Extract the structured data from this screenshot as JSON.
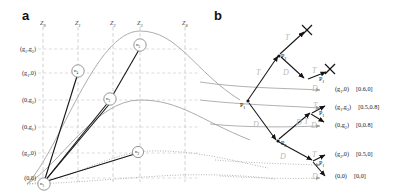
{
  "figure": {
    "panel_a_letter": "a",
    "panel_b_letter": "b"
  },
  "panel_a": {
    "z_labels": [
      "Z0",
      "Z1",
      "Z2",
      "Z3",
      "Z4"
    ],
    "y_labels": [
      "(g1,g2)",
      "(g1,0)",
      "(0,g2)",
      "(0,g1)",
      "(g2,0)",
      "(0,0)"
    ],
    "nodes": [
      {
        "id": "n5",
        "label": "n5"
      },
      {
        "id": "n4",
        "label": "n4"
      },
      {
        "id": "n3",
        "label": "n3"
      },
      {
        "id": "n2",
        "label": "n2"
      },
      {
        "id": "n1",
        "label": "n1"
      }
    ]
  },
  "panel_b": {
    "decision_nodes": [
      {
        "label": "P1"
      },
      {
        "label": "P2"
      },
      {
        "label": "P2"
      },
      {
        "label": "P1"
      },
      {
        "label": "P1"
      },
      {
        "label": "P1"
      }
    ],
    "edge_labels": [
      {
        "label": "T"
      },
      {
        "label": "T"
      },
      {
        "label": "D"
      },
      {
        "label": "T"
      },
      {
        "label": "D"
      },
      {
        "label": "D"
      },
      {
        "label": "T"
      },
      {
        "label": "D"
      },
      {
        "label": "T"
      },
      {
        "label": "D"
      },
      {
        "label": "D"
      },
      {
        "label": "T"
      },
      {
        "label": "D"
      }
    ],
    "terminals": [
      {
        "marker": "X"
      },
      {
        "marker": "X"
      }
    ],
    "outcomes": [
      {
        "state": "(g1,0)",
        "payoff": "[0.6,0]"
      },
      {
        "state": "(g1,g2)",
        "payoff": "[0.5,0.8]"
      },
      {
        "state": "(0,g2)",
        "payoff": "[0,0.8]"
      },
      {
        "state": "(g2,0)",
        "payoff": "[0.5,0]"
      },
      {
        "state": "(0,0)",
        "payoff": "[0,0]"
      }
    ]
  },
  "colors": {
    "solid_edge": "#1a1a1a",
    "curve": "#9a9a9a",
    "grid": "#c9c9c9",
    "script": "#bdbdbd"
  }
}
